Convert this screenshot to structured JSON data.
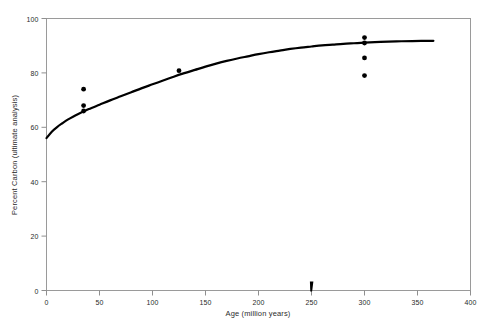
{
  "chart_data": {
    "type": "scatter",
    "title": "",
    "subtitle": "",
    "xlabel": "Age (million years)",
    "ylabel": "Percent Carbon (ultimate analysis)",
    "xlim": [
      0,
      400
    ],
    "ylim": [
      0,
      100
    ],
    "xticks": [
      0,
      50,
      100,
      150,
      200,
      250,
      300,
      350,
      400
    ],
    "yticks": [
      0,
      20,
      40,
      60,
      80,
      100
    ],
    "grid": false,
    "legend": null,
    "legend_position": "none",
    "series": [
      {
        "name": "Fitted trend curve",
        "type": "line",
        "color": "#000000",
        "linewidth": 2.2,
        "points": [
          {
            "x": 0,
            "y": 56.0
          },
          {
            "x": 5,
            "y": 58.4
          },
          {
            "x": 10,
            "y": 60.1
          },
          {
            "x": 15,
            "y": 61.5
          },
          {
            "x": 20,
            "y": 62.8
          },
          {
            "x": 25,
            "y": 63.9
          },
          {
            "x": 30,
            "y": 64.9
          },
          {
            "x": 35,
            "y": 65.8
          },
          {
            "x": 40,
            "y": 66.7
          },
          {
            "x": 50,
            "y": 68.3
          },
          {
            "x": 60,
            "y": 69.9
          },
          {
            "x": 70,
            "y": 71.4
          },
          {
            "x": 80,
            "y": 72.9
          },
          {
            "x": 90,
            "y": 74.4
          },
          {
            "x": 100,
            "y": 75.8
          },
          {
            "x": 110,
            "y": 77.2
          },
          {
            "x": 120,
            "y": 78.6
          },
          {
            "x": 130,
            "y": 79.9
          },
          {
            "x": 140,
            "y": 81.1
          },
          {
            "x": 150,
            "y": 82.3
          },
          {
            "x": 160,
            "y": 83.4
          },
          {
            "x": 170,
            "y": 84.4
          },
          {
            "x": 180,
            "y": 85.3
          },
          {
            "x": 190,
            "y": 86.1
          },
          {
            "x": 200,
            "y": 86.9
          },
          {
            "x": 210,
            "y": 87.6
          },
          {
            "x": 220,
            "y": 88.2
          },
          {
            "x": 230,
            "y": 88.8
          },
          {
            "x": 240,
            "y": 89.3
          },
          {
            "x": 250,
            "y": 89.7
          },
          {
            "x": 260,
            "y": 90.1
          },
          {
            "x": 270,
            "y": 90.4
          },
          {
            "x": 280,
            "y": 90.7
          },
          {
            "x": 290,
            "y": 90.9
          },
          {
            "x": 300,
            "y": 91.1
          },
          {
            "x": 315,
            "y": 91.4
          },
          {
            "x": 330,
            "y": 91.6
          },
          {
            "x": 345,
            "y": 91.7
          },
          {
            "x": 365,
            "y": 91.8
          }
        ]
      },
      {
        "name": "Coal samples",
        "type": "scatter",
        "color": "#000000",
        "marker": "circle",
        "marker_size": 4,
        "points": [
          {
            "x": 35,
            "y": 74.0
          },
          {
            "x": 35,
            "y": 68.0
          },
          {
            "x": 35,
            "y": 66.0
          },
          {
            "x": 125,
            "y": 80.8
          },
          {
            "x": 300,
            "y": 93.0
          },
          {
            "x": 300,
            "y": 91.0
          },
          {
            "x": 300,
            "y": 85.5
          },
          {
            "x": 300,
            "y": 79.0
          }
        ]
      }
    ],
    "annotations": [
      {
        "name": "axis-marker-250",
        "type": "tick-marker",
        "x": 250,
        "y": 0,
        "text": ""
      }
    ]
  },
  "axes": {
    "x_tick_labels": [
      "0",
      "50",
      "100",
      "150",
      "200",
      "250",
      "300",
      "350",
      "400"
    ],
    "y_tick_labels": [
      "0",
      "20",
      "40",
      "60",
      "80",
      "100"
    ],
    "x_title": "Age (million years)",
    "y_title": "Percent Carbon (ultimate analysis)"
  },
  "colors": {
    "background": "#ffffff",
    "frame": "#9a9a9a",
    "data": "#000000",
    "text": "#2b2b2b"
  }
}
